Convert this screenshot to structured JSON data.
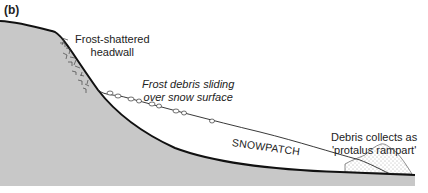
{
  "figure": {
    "panel_label": "(b)",
    "labels": {
      "headwall": [
        "Frost-shattered",
        "headwall"
      ],
      "debris_sliding": [
        "Frost debris sliding",
        "over snow surface"
      ],
      "snowpatch": "SNOWPATCH",
      "rampart": [
        "Debris collects as",
        "'protalus rampart'"
      ]
    },
    "colors": {
      "ground": "#c8c8c8",
      "outline": "#111111",
      "snow": "#ffffff",
      "text": "#222222"
    }
  }
}
